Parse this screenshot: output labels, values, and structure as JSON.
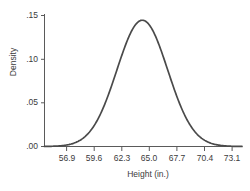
{
  "chart_data": {
    "type": "line",
    "title": "",
    "subtitle": "",
    "xlabel": "Height (in.)",
    "ylabel": "Density",
    "x_tick_labels": [
      "56.9",
      "59.6",
      "62.3",
      "65.0",
      "67.7",
      "70.4",
      "73.1"
    ],
    "x_tick_values": [
      56.9,
      59.6,
      62.3,
      65.0,
      67.7,
      70.4,
      73.1
    ],
    "y_tick_labels": [
      ".15",
      ".10",
      ".05",
      ".00"
    ],
    "y_tick_values": [
      0.15,
      0.1,
      0.05,
      0.0
    ],
    "xlim": [
      54.6,
      75.6
    ],
    "ylim": [
      0.0,
      0.155
    ],
    "grid": false,
    "legend": false,
    "series": [
      {
        "name": "Normal density of height",
        "distribution": "normal",
        "mean": 65.0,
        "sd": 2.7,
        "peak_density": 0.1477,
        "color": "#4a4a4a",
        "line_width": 1.7,
        "x": [
          54.6,
          55.4,
          56.2,
          56.9,
          57.7,
          58.5,
          59.3,
          59.6,
          60.1,
          60.9,
          61.7,
          62.3,
          62.5,
          63.3,
          64.1,
          65.0,
          65.9,
          66.7,
          67.5,
          67.7,
          68.3,
          69.1,
          69.9,
          70.4,
          70.7,
          71.5,
          72.3,
          73.1,
          73.9,
          74.7,
          75.6
        ],
        "y": [
          0.0007,
          0.0014,
          0.0027,
          0.0044,
          0.0075,
          0.012,
          0.0183,
          0.021,
          0.0263,
          0.0355,
          0.0454,
          0.0523,
          0.0545,
          0.0623,
          0.0687,
          0.0739,
          0.0687,
          0.0623,
          0.0545,
          0.0523,
          0.0454,
          0.0355,
          0.0263,
          0.021,
          0.0183,
          0.012,
          0.0075,
          0.0044,
          0.0024,
          0.0012,
          0.0005
        ]
      }
    ]
  },
  "axes": {
    "y_axis_color": "#5a5a5a",
    "x_axis_color": "#5a5a5a",
    "tick_color": "#5a5a5a"
  },
  "background_color": "#ffffff"
}
